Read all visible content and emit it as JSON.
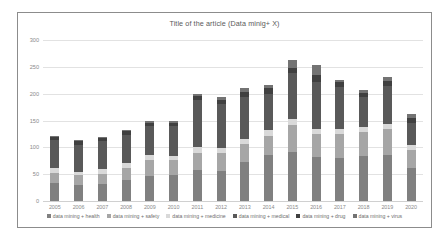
{
  "chart_data": {
    "type": "bar",
    "title": "Title of the article (Data minig+ X)",
    "xlabel": "",
    "ylabel": "",
    "ylim": [
      0,
      300
    ],
    "yticks": [
      0,
      50,
      100,
      150,
      200,
      250,
      300
    ],
    "ytick_labels": [
      "0",
      "50",
      "100",
      "150",
      "200",
      "250",
      "300"
    ],
    "grid": true,
    "stacked": true,
    "legend_position": "bottom",
    "categories": [
      "2005",
      "2006",
      "2007",
      "2008",
      "2009",
      "2010",
      "2011",
      "2012",
      "2013",
      "2014",
      "2015",
      "2016",
      "2017",
      "2018",
      "2019",
      "2020"
    ],
    "series": [
      {
        "name": "data mining + health",
        "color": "#808080",
        "values": [
          33,
          30,
          31,
          40,
          46,
          48,
          58,
          55,
          72,
          86,
          92,
          82,
          80,
          84,
          86,
          62
        ]
      },
      {
        "name": "data mining + safety",
        "color": "#a6a6a6",
        "values": [
          20,
          18,
          20,
          22,
          30,
          28,
          32,
          34,
          34,
          36,
          50,
          42,
          44,
          44,
          48,
          34
        ]
      },
      {
        "name": "data mining + medicine",
        "color": "#d9d9d9",
        "values": [
          8,
          7,
          8,
          8,
          10,
          8,
          10,
          10,
          10,
          10,
          10,
          10,
          10,
          10,
          10,
          8
        ]
      },
      {
        "name": "data mining + medical",
        "color": "#595959",
        "values": [
          52,
          50,
          52,
          54,
          54,
          56,
          88,
          82,
          78,
          68,
          86,
          88,
          78,
          56,
          70,
          42
        ]
      },
      {
        "name": "data mining + drug",
        "color": "#404040",
        "values": [
          6,
          6,
          6,
          6,
          6,
          6,
          8,
          8,
          10,
          10,
          10,
          12,
          10,
          8,
          10,
          8
        ]
      },
      {
        "name": "data mining + virus",
        "color": "#737373",
        "values": [
          3,
          3,
          3,
          3,
          3,
          4,
          4,
          4,
          6,
          6,
          14,
          20,
          4,
          4,
          8,
          8
        ]
      }
    ]
  },
  "colors": {
    "frame_border": "#8c8c8c",
    "gridline": "#e2e2e2",
    "tick_text": "#8a8a8a",
    "title_text": "#5a5a5a",
    "legend_text": "#6e6e6e",
    "background": "#ffffff"
  }
}
